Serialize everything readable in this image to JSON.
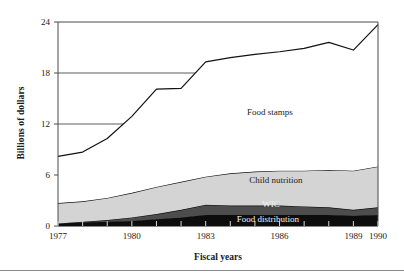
{
  "chart_data": {
    "type": "area",
    "title": "",
    "xlabel": "Fiscal years",
    "ylabel": "Billions of dollars",
    "stacked": true,
    "grid": true,
    "legend_position": "inline-labels",
    "xlim": [
      1977,
      1990
    ],
    "ylim": [
      0,
      24
    ],
    "ytick_labels": [
      "0",
      "6",
      "12",
      "18",
      "24"
    ],
    "ytick_values": [
      0,
      6,
      12,
      18,
      24
    ],
    "xtick_labels": [
      "1977",
      "1980",
      "1983",
      "1986",
      "1989",
      "1990"
    ],
    "xtick_values": [
      1977,
      1980,
      1983,
      1986,
      1989,
      1990
    ],
    "x": [
      1977,
      1978,
      1979,
      1980,
      1981,
      1982,
      1983,
      1984,
      1985,
      1986,
      1987,
      1988,
      1989,
      1990
    ],
    "series": [
      {
        "name": "Food distribution",
        "color": "#0d0d0d",
        "values": [
          0.3,
          0.4,
          0.5,
          0.6,
          0.8,
          1.0,
          1.3,
          1.3,
          1.3,
          1.3,
          1.3,
          1.3,
          1.2,
          1.3
        ]
      },
      {
        "name": "WIC",
        "color": "#4d4d4d",
        "values": [
          0.0,
          0.1,
          0.2,
          0.4,
          0.6,
          0.9,
          1.2,
          1.1,
          1.1,
          1.1,
          1.0,
          0.9,
          0.7,
          0.9
        ]
      },
      {
        "name": "Child nutrition",
        "color": "#d4d4d4",
        "values": [
          2.4,
          2.4,
          2.6,
          2.9,
          3.2,
          3.3,
          3.3,
          3.8,
          4.0,
          4.1,
          4.2,
          4.4,
          4.6,
          4.8
        ]
      },
      {
        "name": "Food stamps",
        "color": "#ffffff",
        "values": [
          5.5,
          5.8,
          7.0,
          9.0,
          11.5,
          11.0,
          13.5,
          13.6,
          13.8,
          14.0,
          14.4,
          15.0,
          14.2,
          16.7
        ]
      }
    ],
    "totals": [
      8.2,
      8.7,
      10.3,
      12.9,
      16.1,
      16.2,
      19.3,
      19.8,
      20.2,
      20.5,
      20.9,
      21.6,
      20.7,
      23.7
    ],
    "gridlines": [
      {
        "value": 24,
        "full_width": true
      },
      {
        "value": 18,
        "full_width": false,
        "x_end": 1983
      },
      {
        "value": 12,
        "full_width": false,
        "x_end": 1980
      },
      {
        "value": 6,
        "full_width": false,
        "x_end": 1977.1
      }
    ],
    "series_label_positions": [
      {
        "name": "Food stamps",
        "x": 270,
        "y": 115
      },
      {
        "name": "Child nutrition",
        "x": 276,
        "y": 183
      },
      {
        "name": "WIC",
        "x": 271,
        "y": 207
      },
      {
        "name": "Food distribution",
        "x": 268,
        "y": 222
      }
    ]
  },
  "axis": {
    "ylabel": "Billions of dollars",
    "xlabel": "Fiscal years"
  }
}
